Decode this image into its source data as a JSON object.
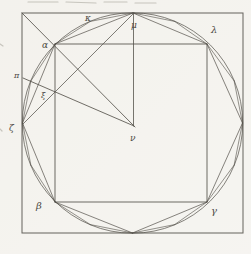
{
  "figure": {
    "paper_color": "#f4f3ee",
    "ink_color": "#55524b",
    "artifact_color": "#bcbab2",
    "canvas": {
      "width": 251,
      "height": 254
    },
    "outer_square": {
      "x": 22,
      "y": 13,
      "width": 221,
      "height": 220
    },
    "inner_square": {
      "x": 55,
      "y": 44,
      "width": 152,
      "height": 158
    },
    "circle": {
      "cx": 132.5,
      "cy": 123,
      "r": 110.2
    },
    "labels": [
      {
        "name": "label-kappa",
        "text": "κ",
        "x": 85,
        "y": 21,
        "size": 9
      },
      {
        "name": "label-mu",
        "text": "μ",
        "x": 131,
        "y": 28,
        "size": 9
      },
      {
        "name": "label-lambda",
        "text": "λ",
        "x": 211,
        "y": 33,
        "size": 10
      },
      {
        "name": "label-alpha",
        "text": "α",
        "x": 42,
        "y": 48,
        "size": 9
      },
      {
        "name": "label-pi",
        "text": "π",
        "x": 14,
        "y": 78,
        "size": 8
      },
      {
        "name": "label-xi",
        "text": "ξ",
        "x": 41,
        "y": 98,
        "size": 8
      },
      {
        "name": "label-zeta",
        "text": "ζ",
        "x": 9,
        "y": 131,
        "size": 9
      },
      {
        "name": "label-nu",
        "text": "ν",
        "x": 130,
        "y": 141,
        "size": 9
      },
      {
        "name": "label-beta",
        "text": "β",
        "x": 36,
        "y": 209,
        "size": 10
      },
      {
        "name": "label-gamma",
        "text": "γ",
        "x": 211,
        "y": 214,
        "size": 10
      }
    ],
    "segments": [
      {
        "name": "octagon-chord-left-alpha",
        "x1": 22.5,
        "y1": 123,
        "x2": 55,
        "y2": 44,
        "w": 0.8
      },
      {
        "name": "octagon-chord-alpha-top",
        "x1": 55,
        "y1": 44,
        "x2": 133,
        "y2": 13,
        "w": 0.8
      },
      {
        "name": "octagon-chord-top-lambda",
        "x1": 133,
        "y1": 13,
        "x2": 207,
        "y2": 44,
        "w": 0.8
      },
      {
        "name": "octagon-chord-lambda-right",
        "x1": 207,
        "y1": 44,
        "x2": 242.5,
        "y2": 123,
        "w": 0.8
      },
      {
        "name": "octagon-chord-right-gamma",
        "x1": 242.5,
        "y1": 123,
        "x2": 207,
        "y2": 202,
        "w": 0.8
      },
      {
        "name": "octagon-chord-gamma-bottom",
        "x1": 207,
        "y1": 202,
        "x2": 132.5,
        "y2": 233,
        "w": 0.8
      },
      {
        "name": "octagon-chord-bottom-beta",
        "x1": 132.5,
        "y1": 233,
        "x2": 55,
        "y2": 202,
        "w": 0.8
      },
      {
        "name": "octagon-chord-beta-left",
        "x1": 55,
        "y1": 202,
        "x2": 22.5,
        "y2": 123,
        "w": 0.8
      },
      {
        "name": "hexadecagon-edge-1",
        "x1": 22.5,
        "y1": 123,
        "x2": 30.9,
        "y2": 80.9,
        "w": 0.7
      },
      {
        "name": "hexadecagon-edge-2",
        "x1": 30.9,
        "y1": 80.9,
        "x2": 55,
        "y2": 44,
        "w": 0.7
      },
      {
        "name": "hexadecagon-edge-3",
        "x1": 55,
        "y1": 44,
        "x2": 90.4,
        "y2": 21.4,
        "w": 0.7
      },
      {
        "name": "hexadecagon-edge-4",
        "x1": 90.4,
        "y1": 21.4,
        "x2": 133,
        "y2": 13,
        "w": 0.7
      },
      {
        "name": "hexadecagon-edge-5",
        "x1": 133,
        "y1": 13,
        "x2": 174.6,
        "y2": 21.4,
        "w": 0.7
      },
      {
        "name": "hexadecagon-edge-6",
        "x1": 174.6,
        "y1": 21.4,
        "x2": 207,
        "y2": 44,
        "w": 0.7
      },
      {
        "name": "hexadecagon-edge-7",
        "x1": 207,
        "y1": 44,
        "x2": 234.1,
        "y2": 80.9,
        "w": 0.7
      },
      {
        "name": "hexadecagon-edge-8",
        "x1": 234.1,
        "y1": 80.9,
        "x2": 242.5,
        "y2": 123,
        "w": 0.7
      },
      {
        "name": "hexadecagon-edge-9",
        "x1": 242.5,
        "y1": 123,
        "x2": 234.1,
        "y2": 165.1,
        "w": 0.7
      },
      {
        "name": "hexadecagon-edge-10",
        "x1": 234.1,
        "y1": 165.1,
        "x2": 207,
        "y2": 202,
        "w": 0.7
      },
      {
        "name": "hexadecagon-edge-11",
        "x1": 207,
        "y1": 202,
        "x2": 174.6,
        "y2": 224.6,
        "w": 0.7
      },
      {
        "name": "hexadecagon-edge-12",
        "x1": 174.6,
        "y1": 224.6,
        "x2": 132.5,
        "y2": 233,
        "w": 0.7
      },
      {
        "name": "hexadecagon-edge-13",
        "x1": 132.5,
        "y1": 233,
        "x2": 90.4,
        "y2": 224.6,
        "w": 0.7
      },
      {
        "name": "hexadecagon-edge-14",
        "x1": 90.4,
        "y1": 224.6,
        "x2": 55,
        "y2": 202,
        "w": 0.7
      },
      {
        "name": "hexadecagon-edge-15",
        "x1": 55,
        "y1": 202,
        "x2": 30.9,
        "y2": 165.1,
        "w": 0.7
      },
      {
        "name": "hexadecagon-edge-16",
        "x1": 30.9,
        "y1": 165.1,
        "x2": 22.5,
        "y2": 123,
        "w": 0.7
      },
      {
        "name": "diagonal-corner-alpha-center",
        "x1": 22,
        "y1": 13,
        "x2": 135,
        "y2": 127,
        "w": 0.95
      },
      {
        "name": "chord-left-to-top",
        "x1": 23,
        "y1": 124,
        "x2": 134,
        "y2": 13,
        "w": 0.85
      },
      {
        "name": "radius-top-to-center",
        "x1": 133.5,
        "y1": 14,
        "x2": 133.5,
        "y2": 126,
        "w": 0.9
      },
      {
        "name": "radius-pi-to-center",
        "x1": 23,
        "y1": 78,
        "x2": 134,
        "y2": 126,
        "w": 0.95
      }
    ],
    "artifacts": [
      {
        "name": "scan-dash-1",
        "x1": 28,
        "y1": 2,
        "x2": 58,
        "y2": 2
      },
      {
        "name": "scan-dash-2",
        "x1": 66,
        "y1": 2,
        "x2": 96,
        "y2": 3
      },
      {
        "name": "scan-dash-3",
        "x1": 104,
        "y1": 2,
        "x2": 127,
        "y2": 2
      },
      {
        "name": "scan-dash-4",
        "x1": 135,
        "y1": 3,
        "x2": 156,
        "y2": 3
      },
      {
        "name": "edge-tick-1",
        "x1": 0,
        "y1": 44,
        "x2": 3,
        "y2": 46
      },
      {
        "name": "edge-tick-2",
        "x1": 0,
        "y1": 129,
        "x2": 2,
        "y2": 131
      }
    ]
  }
}
